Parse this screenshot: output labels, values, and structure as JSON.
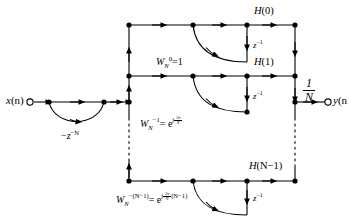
{
  "diagram": {
    "colors": {
      "line": "#000000",
      "background": "#ffffff"
    },
    "input": {
      "name": "input-terminal",
      "label_var": "x",
      "label_arg": "(n)"
    },
    "output": {
      "name": "output-terminal",
      "label_var": "y",
      "label_arg": "(n",
      "gain_num": "1",
      "gain_den": "N"
    },
    "comb": {
      "label_sign": "−",
      "label_var": "z",
      "label_exp": "−N"
    },
    "rows": [
      {
        "id": "row-0",
        "h_label_var": "H",
        "h_label_arg": "(0)",
        "delay_label_var": "z",
        "delay_label_exp": "−1",
        "coef_base": "W",
        "coef_sub": "N",
        "coef_sup": "0",
        "coef_eq": "=1",
        "coef_has_exp": false
      },
      {
        "id": "row-1",
        "h_label_var": "H",
        "h_label_arg": "(1)",
        "delay_label_var": "z",
        "delay_label_exp": "−1",
        "coef_base": "W",
        "coef_sub": "N",
        "coef_sup": "−1",
        "coef_eq": "= e",
        "coef_has_exp": true,
        "exp_j": "j",
        "exp_num": "2π",
        "exp_den": "N",
        "exp_tail": ""
      },
      {
        "id": "row-n-1",
        "h_label_var": "H",
        "h_label_arg": "(N−1)",
        "delay_label_var": "z",
        "delay_label_exp": "−1",
        "coef_base": "W",
        "coef_sub": "N",
        "coef_sup": "−(N−1)",
        "coef_eq": "= e",
        "coef_has_exp": true,
        "exp_j": "j",
        "exp_num": "2π",
        "exp_den": "N",
        "exp_tail": "(N−1)"
      }
    ]
  }
}
